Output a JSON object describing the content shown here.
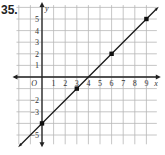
{
  "problem_number": "35.",
  "chart_data": {
    "type": "line",
    "title": "",
    "xlabel": "x",
    "ylabel": "y",
    "origin_label": "O",
    "xlim": [
      -2.2,
      9.9
    ],
    "ylim": [
      -5.8,
      6.2
    ],
    "grid": true,
    "x_ticks": [
      1,
      2,
      3,
      4,
      5,
      6,
      7,
      8,
      9
    ],
    "y_ticks": [
      5,
      4,
      3,
      2,
      1,
      -2,
      -3,
      -5
    ],
    "series": [
      {
        "name": "y = x - 4",
        "line": {
          "slope": 1,
          "intercept": -4
        },
        "points": [
          {
            "x": 0,
            "y": -4
          },
          {
            "x": 3,
            "y": -1
          },
          {
            "x": 6,
            "y": 2
          },
          {
            "x": 9,
            "y": 5
          }
        ]
      }
    ]
  },
  "colors": {
    "grid": "#b8b8b8",
    "axis": "#222222",
    "line": "#1a1a1a",
    "point": "#111111"
  }
}
